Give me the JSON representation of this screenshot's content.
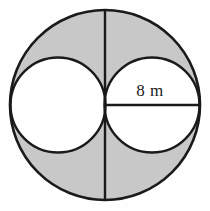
{
  "figure": {
    "background_color": "#fefefe",
    "shaded_color": "#c8c8c8",
    "unshaded_color": "#ffffff",
    "stroke_color": "#1a1a1a",
    "label": {
      "text": "8 m",
      "value": 8,
      "unit": "m",
      "measures": "radius-of-inner-circle",
      "x": 150,
      "y": 96
    },
    "outer_circle": {
      "name": "outer-circle",
      "cx": 105,
      "cy": 105,
      "r": 95,
      "fill": "#c8c8c8",
      "stroke_width": 2.6
    },
    "inner_circle_left": {
      "name": "left-inner-circle",
      "cx": 58,
      "cy": 105,
      "r": 47.5,
      "fill": "#ffffff",
      "stroke_width": 2.4
    },
    "inner_circle_right": {
      "name": "right-inner-circle",
      "cx": 152,
      "cy": 105,
      "r": 47.5,
      "fill": "#ffffff",
      "stroke_width": 2.4
    },
    "vertical_diameter": {
      "name": "vertical-diameter-line",
      "x1": 105,
      "y1": 10,
      "x2": 105,
      "y2": 200,
      "stroke_width": 2.4
    },
    "horizontal_radius": {
      "name": "horizontal-radius-line",
      "x1": 105,
      "y1": 105,
      "x2": 200,
      "y2": 105,
      "stroke_width": 2.6
    }
  }
}
